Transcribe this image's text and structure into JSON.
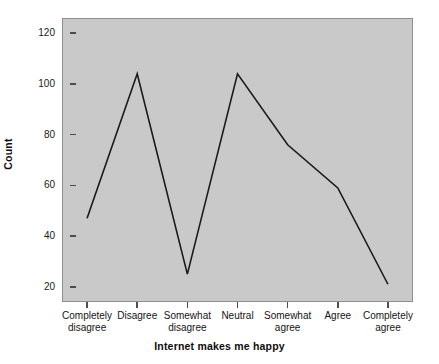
{
  "chart_data": {
    "type": "line",
    "title": "",
    "subtitle": "",
    "xlabel": "Internet makes me happy",
    "ylabel": "Count",
    "categories": [
      "Completely\ndisagree",
      "Disagree",
      "Somewhat\ndisagree",
      "Neutral",
      "Somewhat\nagree",
      "Agree",
      "Completely\nagree"
    ],
    "values": [
      47,
      104,
      25,
      104,
      76,
      59,
      21
    ],
    "series": [
      {
        "name": "Count",
        "values": [
          47,
          104,
          25,
          104,
          76,
          59,
          21
        ]
      }
    ],
    "ylim": [
      14,
      126
    ],
    "yticks": [
      20,
      40,
      60,
      80,
      100,
      120
    ],
    "ytick_labels": [
      "20",
      "40",
      "60",
      "80",
      "100",
      "120"
    ],
    "grid": false,
    "legend": false,
    "legend_position": "none",
    "line_color": "#1a1a1a",
    "panel_background": "#c9c9c9",
    "figure_background": "#ffffff",
    "markers": false
  },
  "axes": {
    "y_title": "Count",
    "x_title": "Internet makes me happy"
  }
}
